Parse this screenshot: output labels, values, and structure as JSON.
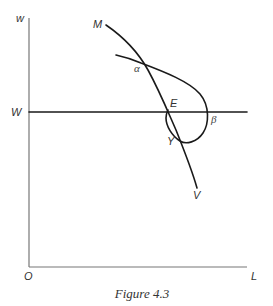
{
  "figure": {
    "caption": "Figure 4.3",
    "axes": {
      "y_label": "w",
      "x_label": "L",
      "origin_label": "O"
    },
    "reference_line": {
      "label": "W"
    },
    "curves": {
      "mv_curve": {
        "start_label": "M",
        "end_label": "V"
      },
      "loop_curve": {
        "description": "loop through alpha, beta and Y"
      }
    },
    "points": {
      "alpha": "α",
      "beta": "β",
      "E": "E",
      "Y": "Y"
    }
  }
}
